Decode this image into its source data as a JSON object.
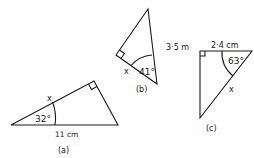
{
  "figures": [
    {
      "id": "a",
      "caption": "(a)",
      "angle_label": "32°",
      "side_label": "11 cm",
      "unknown_label": "x"
    },
    {
      "id": "b",
      "caption": "(b)",
      "angle_label": "41°",
      "side_label": "3·5 m",
      "unknown_label": "x"
    },
    {
      "id": "c",
      "caption": "(c)",
      "angle_label": "63°",
      "side_label": "2·4 cm",
      "unknown_label": "x"
    }
  ],
  "colors": {
    "stroke": "#1a1a1a",
    "background": "#ffffff"
  }
}
